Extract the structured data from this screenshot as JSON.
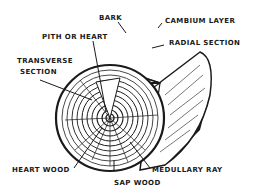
{
  "diagram": {
    "colors": {
      "ink": "#1a1a1a",
      "background": "#ffffff"
    },
    "labels": {
      "bark": "BARK",
      "cambium_layer": "CAMBIUM LAYER",
      "pith_or_heart": "PITH OR HEART",
      "radial_section": "RADIAL SECTION",
      "transverse_section_line1": "TRANSVERSE",
      "transverse_section_line2": "SECTION",
      "heart_wood": "HEART WOOD",
      "medullary_ray": "MEDULLARY RAY",
      "sap_wood": "SAP WOOD"
    }
  }
}
